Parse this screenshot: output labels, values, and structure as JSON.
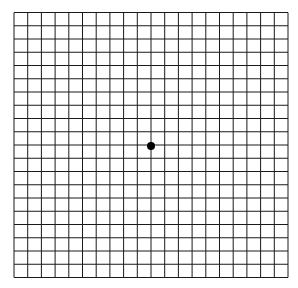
{
  "diagram": {
    "type": "amsler-grid",
    "columns": 20,
    "rows": 20,
    "line_color": "#1a1a1a",
    "background": "#ffffff",
    "dot_color": "#000000",
    "grid_box": {
      "x": 14,
      "y": 12.5,
      "width": 274,
      "height": 265
    },
    "center_dot": {
      "cx": 151,
      "cy": 146,
      "r": 4
    }
  }
}
